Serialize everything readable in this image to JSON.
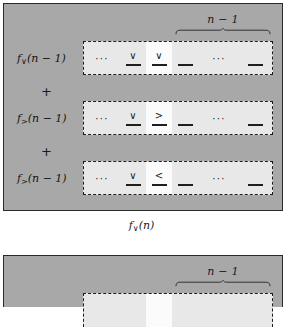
{
  "figure": {
    "panels": [
      {
        "name": "panel-upper",
        "brace_label": "n − 1",
        "caption": "f∨(n)",
        "caption_base": "f",
        "caption_sub": "∨",
        "caption_arg": "(n)",
        "operators": [
          "+",
          "+"
        ],
        "rows": [
          {
            "label_base": "f",
            "label_sub": "∨",
            "label_arg": "(n − 1)",
            "label_full": "f∨(n − 1)",
            "cells": [
              {
                "glyph": "···",
                "rule": false,
                "highlight": false,
                "kind": "ellipsis"
              },
              {
                "glyph": "∨",
                "rule": true,
                "highlight": false,
                "kind": "symbol"
              },
              {
                "glyph": "∨",
                "rule": true,
                "highlight": true,
                "kind": "symbol"
              },
              {
                "glyph": "",
                "rule": true,
                "highlight": false,
                "kind": "blank"
              },
              {
                "glyph": "···",
                "rule": false,
                "highlight": false,
                "kind": "ellipsis"
              },
              {
                "glyph": "",
                "rule": true,
                "highlight": false,
                "kind": "blank"
              }
            ]
          },
          {
            "label_base": "f",
            "label_sub": ">",
            "label_arg": "(n − 1)",
            "label_full": "f>(n − 1)",
            "cells": [
              {
                "glyph": "···",
                "rule": false,
                "highlight": false,
                "kind": "ellipsis"
              },
              {
                "glyph": "∨",
                "rule": true,
                "highlight": false,
                "kind": "symbol"
              },
              {
                "glyph": ">",
                "rule": true,
                "highlight": true,
                "kind": "symbol"
              },
              {
                "glyph": "",
                "rule": true,
                "highlight": false,
                "kind": "blank"
              },
              {
                "glyph": "···",
                "rule": false,
                "highlight": false,
                "kind": "ellipsis"
              },
              {
                "glyph": "",
                "rule": true,
                "highlight": false,
                "kind": "blank"
              }
            ]
          },
          {
            "label_base": "f",
            "label_sub": ">",
            "label_arg": "(n − 1)",
            "label_full": "f>(n − 1)",
            "cells": [
              {
                "glyph": "···",
                "rule": false,
                "highlight": false,
                "kind": "ellipsis"
              },
              {
                "glyph": "∨",
                "rule": true,
                "highlight": false,
                "kind": "symbol"
              },
              {
                "glyph": "<",
                "rule": true,
                "highlight": true,
                "kind": "symbol"
              },
              {
                "glyph": "",
                "rule": true,
                "highlight": false,
                "kind": "blank"
              },
              {
                "glyph": "···",
                "rule": false,
                "highlight": false,
                "kind": "ellipsis"
              },
              {
                "glyph": "",
                "rule": true,
                "highlight": false,
                "kind": "blank"
              }
            ]
          }
        ]
      },
      {
        "name": "panel-lower",
        "brace_label": "n − 1",
        "caption": "",
        "rows": []
      }
    ],
    "colors": {
      "panel_bg": "#a8a8a8",
      "panel_border": "#2b2b2b",
      "box_bg": "#e8e8e8",
      "box_border": "#1c1c1c",
      "highlight_bg": "#fbfbfb",
      "text": "#1b1b1b",
      "page_bg": "#ffffff"
    }
  }
}
